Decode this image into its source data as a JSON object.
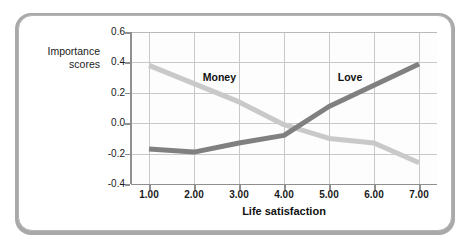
{
  "figure": {
    "y_axis_title": "Importance\nscores",
    "y_axis_title_line1": "Importance",
    "y_axis_title_line2": "scores",
    "x_axis_title": "Life satisfaction"
  },
  "chart_data": {
    "type": "line",
    "title": "",
    "xlabel": "Life satisfaction",
    "ylabel": "Importance scores",
    "x": [
      1,
      2,
      3,
      4,
      5,
      6,
      7
    ],
    "categories": [
      "1.00",
      "2.00",
      "3.00",
      "4.00",
      "5.00",
      "6.00",
      "7.00"
    ],
    "xtick_labels": [
      "1.00",
      "2.00",
      "3.00",
      "4.00",
      "5.00",
      "6.00",
      "7.00"
    ],
    "ytick_labels": [
      "0.6",
      "0.4",
      "0.2",
      "0.0",
      "-0.2",
      "-0.4"
    ],
    "ytick_values": [
      0.6,
      0.4,
      0.2,
      0.0,
      -0.2,
      -0.4
    ],
    "xlim": [
      0.6,
      7.4
    ],
    "ylim": [
      -0.4,
      0.6
    ],
    "grid": true,
    "legend_position": "inline-annotations",
    "series": [
      {
        "name": "Money",
        "color": "#c9c9c9",
        "line_width": 5,
        "values": [
          0.38,
          0.26,
          0.14,
          -0.01,
          -0.1,
          -0.13,
          -0.26
        ],
        "label_x": 2.55,
        "label_y": 0.3
      },
      {
        "name": "Love",
        "color": "#808080",
        "line_width": 5,
        "values": [
          -0.17,
          -0.19,
          -0.13,
          -0.08,
          0.11,
          0.25,
          0.39
        ],
        "label_x": 5.55,
        "label_y": 0.3
      }
    ],
    "annotations": [
      {
        "text": "Money",
        "x": 2.55,
        "y": 0.3
      },
      {
        "text": "Love",
        "x": 5.55,
        "y": 0.3
      }
    ]
  },
  "colors": {
    "money_line": "#c9c9c9",
    "love_line": "#808080",
    "gridline": "#c9c9c9",
    "axis": "#8f8f8f",
    "card_border": "#b5b5b5",
    "card_shadow": "#a9a9a9",
    "text": "#1a1a1a",
    "background": "#ffffff"
  }
}
